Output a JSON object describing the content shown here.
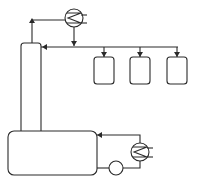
{
  "diagram": {
    "type": "process-flow",
    "stroke_color": "#2a2a2a",
    "background": "#ffffff",
    "components": [
      {
        "id": "column",
        "kind": "distillation-column"
      },
      {
        "id": "reboiler-vessel",
        "kind": "vessel"
      },
      {
        "id": "condenser",
        "kind": "heat-exchanger"
      },
      {
        "id": "reboiler-exchanger",
        "kind": "heat-exchanger"
      },
      {
        "id": "pump",
        "kind": "pump"
      },
      {
        "id": "receiver-1",
        "kind": "tank"
      },
      {
        "id": "receiver-2",
        "kind": "tank"
      },
      {
        "id": "receiver-3",
        "kind": "tank"
      }
    ],
    "streams": [
      {
        "from": "column",
        "to": "condenser"
      },
      {
        "from": "condenser",
        "to": "header"
      },
      {
        "from": "header",
        "to": "column"
      },
      {
        "from": "header",
        "to": "receiver-1"
      },
      {
        "from": "header",
        "to": "receiver-2"
      },
      {
        "from": "header",
        "to": "receiver-3"
      },
      {
        "from": "reboiler-vessel",
        "to": "pump"
      },
      {
        "from": "pump",
        "to": "reboiler-exchanger"
      },
      {
        "from": "reboiler-exchanger",
        "to": "reboiler-vessel"
      }
    ]
  }
}
